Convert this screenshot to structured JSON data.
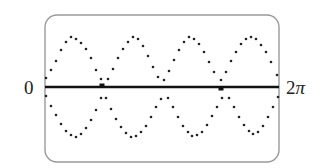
{
  "chart_data": {
    "type": "scatter",
    "title": "",
    "xlabel": "",
    "ylabel": "",
    "x_tick_labels": {
      "start": "0",
      "end": "2π"
    },
    "xlim_label": [
      "0",
      "2π"
    ],
    "grid": false,
    "legend": null,
    "frame": {
      "x": 45,
      "y": 15,
      "w": 234,
      "h": 147,
      "radius": 12,
      "stroke": "#9a9a9a"
    },
    "axis": {
      "y": 87,
      "x0": 45,
      "x1": 279,
      "stroke": "#111111",
      "width": 2.5
    },
    "axis_markers": [
      {
        "x": 102,
        "side": "above"
      },
      {
        "x": 221,
        "side": "below"
      }
    ],
    "dot_color": "#222222",
    "series": [
      {
        "name": "upper-curve",
        "description": "dotted oscillation above axis, ~4 periods, peaks near y=36, troughs near y=80",
        "points": [
          [
            46,
            78
          ],
          [
            51,
            70
          ],
          [
            56,
            61
          ],
          [
            61,
            50
          ],
          [
            66,
            42
          ],
          [
            71,
            37
          ],
          [
            76,
            39
          ],
          [
            81,
            43
          ],
          [
            86,
            49
          ],
          [
            91,
            58
          ],
          [
            96,
            70
          ],
          [
            101,
            79
          ],
          [
            108,
            79
          ],
          [
            113,
            69
          ],
          [
            118,
            58
          ],
          [
            123,
            49
          ],
          [
            128,
            42
          ],
          [
            133,
            37
          ],
          [
            138,
            39
          ],
          [
            143,
            46
          ],
          [
            148,
            56
          ],
          [
            153,
            67
          ],
          [
            158,
            77
          ],
          [
            164,
            80
          ],
          [
            169,
            71
          ],
          [
            174,
            60
          ],
          [
            179,
            50
          ],
          [
            184,
            42
          ],
          [
            189,
            37
          ],
          [
            194,
            39
          ],
          [
            199,
            44
          ],
          [
            204,
            52
          ],
          [
            209,
            62
          ],
          [
            214,
            72
          ],
          [
            221,
            80
          ],
          [
            226,
            72
          ],
          [
            231,
            61
          ],
          [
            236,
            52
          ],
          [
            241,
            44
          ],
          [
            246,
            39
          ],
          [
            251,
            37
          ],
          [
            256,
            39
          ],
          [
            261,
            45
          ],
          [
            266,
            52
          ],
          [
            271,
            62
          ],
          [
            277,
            75
          ]
        ]
      },
      {
        "name": "lower-curve",
        "description": "dotted oscillation below axis, mirror image, troughs near y=139, peaks near y=97",
        "points": [
          [
            46,
            96
          ],
          [
            51,
            106
          ],
          [
            56,
            115
          ],
          [
            61,
            124
          ],
          [
            66,
            131
          ],
          [
            71,
            135
          ],
          [
            76,
            137
          ],
          [
            81,
            134
          ],
          [
            86,
            128
          ],
          [
            91,
            120
          ],
          [
            96,
            110
          ],
          [
            101,
            98
          ],
          [
            106,
            98
          ],
          [
            111,
            109
          ],
          [
            116,
            119
          ],
          [
            121,
            127
          ],
          [
            126,
            133
          ],
          [
            131,
            137
          ],
          [
            136,
            136
          ],
          [
            141,
            132
          ],
          [
            146,
            126
          ],
          [
            151,
            117
          ],
          [
            156,
            107
          ],
          [
            161,
            99
          ],
          [
            168,
            98
          ],
          [
            173,
            107
          ],
          [
            178,
            117
          ],
          [
            183,
            126
          ],
          [
            188,
            132
          ],
          [
            192,
            136
          ],
          [
            197,
            135
          ],
          [
            202,
            132
          ],
          [
            207,
            125
          ],
          [
            212,
            116
          ],
          [
            217,
            107
          ],
          [
            222,
            98
          ],
          [
            229,
            98
          ],
          [
            234,
            107
          ],
          [
            239,
            117
          ],
          [
            244,
            125
          ],
          [
            249,
            131
          ],
          [
            253,
            134
          ],
          [
            258,
            132
          ],
          [
            263,
            126
          ],
          [
            268,
            117
          ],
          [
            273,
            107
          ],
          [
            278,
            97
          ]
        ]
      }
    ]
  },
  "labels": {
    "left": "0",
    "right_num": "2",
    "right_sym": "π"
  }
}
